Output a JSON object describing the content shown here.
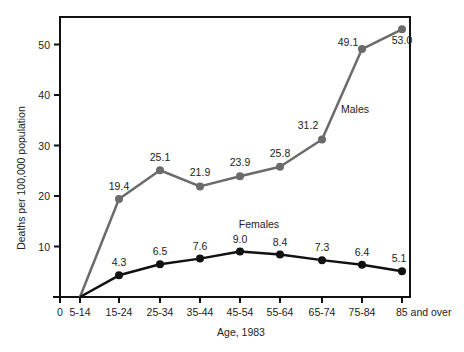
{
  "chart_data": {
    "type": "line",
    "title": "",
    "xlabel": "Age, 1983",
    "ylabel": "Deaths per 100,000 population",
    "ylim": [
      0,
      55
    ],
    "yticks": [
      10,
      20,
      30,
      40,
      50
    ],
    "x_origin_label": "0",
    "categories": [
      "5-14",
      "15-24",
      "25-34",
      "35-44",
      "45-54",
      "55-64",
      "65-74",
      "75-84",
      "85 and over"
    ],
    "grid": false,
    "legend": "inline labels",
    "series": [
      {
        "name": "Males",
        "color": "#6b6b6b",
        "values": [
          0,
          19.4,
          25.1,
          21.9,
          23.9,
          25.8,
          31.2,
          49.1,
          53.0
        ],
        "labels": [
          "",
          "19.4",
          "25.1",
          "21.9",
          "23.9",
          "25.8",
          "31.2",
          "49.1",
          "53.0"
        ]
      },
      {
        "name": "Females",
        "color": "#111111",
        "values": [
          0,
          4.3,
          6.5,
          7.6,
          9.0,
          8.4,
          7.3,
          6.4,
          5.1
        ],
        "labels": [
          "",
          "4.3",
          "6.5",
          "7.6",
          "9.0",
          "8.4",
          "7.3",
          "6.4",
          "5.1"
        ]
      }
    ]
  }
}
